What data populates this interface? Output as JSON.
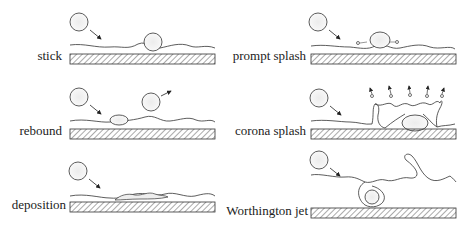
{
  "diagram": {
    "panels": [
      {
        "id": "stick",
        "label": "stick"
      },
      {
        "id": "prompt-splash",
        "label": "prompt splash"
      },
      {
        "id": "rebound",
        "label": "rebound"
      },
      {
        "id": "corona-splash",
        "label": "corona splash"
      },
      {
        "id": "deposition",
        "label": "deposition"
      },
      {
        "id": "worthington-jet",
        "label": "Worthington jet"
      }
    ],
    "colors": {
      "line": "#333333",
      "hatch": "#555555",
      "droplet_fill": "#f2f2f2"
    }
  }
}
